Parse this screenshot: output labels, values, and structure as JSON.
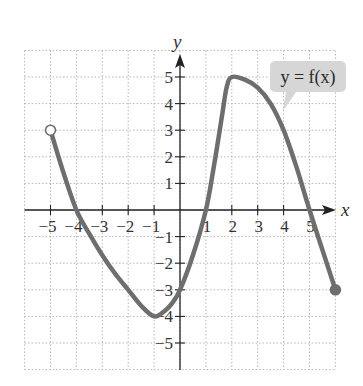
{
  "chart_data": {
    "type": "line",
    "title": "",
    "xlabel": "x",
    "ylabel": "y",
    "xlim": [
      -6,
      6
    ],
    "ylim": [
      -6,
      6
    ],
    "grid": true,
    "x_ticks": [
      -5,
      -4,
      -3,
      -2,
      -1,
      1,
      2,
      3,
      4,
      5
    ],
    "x_tick_labels": [
      "−5",
      "−4",
      "−3",
      "−2",
      "−1",
      "1",
      "2",
      "3",
      "4",
      "5"
    ],
    "y_ticks": [
      -5,
      -4,
      -3,
      -2,
      -1,
      1,
      2,
      3,
      4,
      5
    ],
    "y_tick_labels": [
      "−5",
      "−4",
      "−3",
      "−2",
      "−1",
      "1",
      "2",
      "3",
      "4",
      "5"
    ],
    "series": [
      {
        "name": "y = f(x)",
        "points": [
          [
            -5,
            3
          ],
          [
            -4.5,
            1.4
          ],
          [
            -4,
            0
          ],
          [
            -3.5,
            -0.9
          ],
          [
            -3,
            -1.7
          ],
          [
            -2.5,
            -2.4
          ],
          [
            -2,
            -3.0
          ],
          [
            -1.5,
            -3.6
          ],
          [
            -1,
            -4
          ],
          [
            -0.6,
            -3.8
          ],
          [
            -0.3,
            -3.5
          ],
          [
            0,
            -3
          ],
          [
            0.5,
            -1.7
          ],
          [
            1,
            0
          ],
          [
            1.3,
            1.6
          ],
          [
            1.6,
            3.4
          ],
          [
            1.8,
            4.6
          ],
          [
            2,
            5
          ],
          [
            2.5,
            4.9
          ],
          [
            3,
            4.6
          ],
          [
            3.5,
            4.0
          ],
          [
            4,
            3
          ],
          [
            4.5,
            1.6
          ],
          [
            5,
            0
          ],
          [
            5.5,
            -1.5
          ],
          [
            6,
            -3
          ]
        ],
        "color": "#6e6e6e"
      }
    ],
    "endpoints": [
      {
        "x": -5,
        "y": 3,
        "style": "open"
      },
      {
        "x": 6,
        "y": -3,
        "style": "closed"
      }
    ],
    "annotations": [
      {
        "text": "y = f(x)",
        "anchor": [
          3.9,
          3.8
        ],
        "style": "callout"
      }
    ]
  },
  "labels": {
    "x_axis": "x",
    "y_axis": "y",
    "callout": "y = f(x)"
  },
  "colors": {
    "curve": "#6e6e6e",
    "grid": "#b5b5b5",
    "axis": "#222222",
    "callout_fill": "#d6d6d6"
  }
}
